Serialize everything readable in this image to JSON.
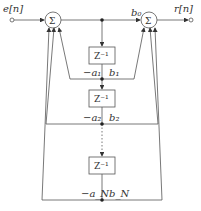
{
  "diagram": {
    "input_label": "e[n]",
    "output_label": "r[n]",
    "sum_symbol": "Σ",
    "delay_label": "Z⁻¹",
    "feedforward_top": "b₀",
    "taps": [
      {
        "a": "−a₁",
        "b": "b₁"
      },
      {
        "a": "−a₂",
        "b": "b₂"
      },
      {
        "a": "−a_N",
        "b": "b_N"
      }
    ],
    "colors": {
      "line": "#555555",
      "box_border": "#555555",
      "text": "#333333"
    }
  }
}
